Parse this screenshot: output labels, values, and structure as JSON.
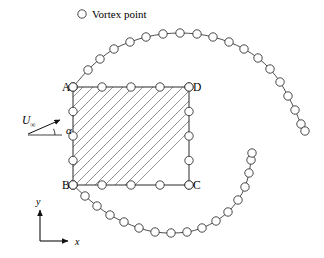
{
  "figure": {
    "width": 324,
    "height": 258,
    "background": "#ffffff",
    "type": "vortex-panel-diagram"
  },
  "legend": {
    "marker": "circle-open",
    "marker_name": "vortex-point-marker",
    "label": "Vortex point",
    "marker_x": 82,
    "marker_y": 14,
    "text_x": 92,
    "text_y": 18
  },
  "body": {
    "name": "square-body",
    "left": 73,
    "top": 87,
    "right": 189,
    "bottom": 185,
    "edge_color": "#2a2a2a",
    "hatch_color": "#777777",
    "hatch_angle_deg": 45,
    "hatch_count": 13,
    "hatch_spacing": 10,
    "corners": [
      {
        "id": "A",
        "label": "A",
        "x": 73,
        "y": 87,
        "label_x": 62,
        "label_y": 91
      },
      {
        "id": "D",
        "label": "D",
        "x": 189,
        "y": 87,
        "label_x": 193,
        "label_y": 91
      },
      {
        "id": "B",
        "label": "B",
        "x": 73,
        "y": 185,
        "label_x": 62,
        "label_y": 189
      },
      {
        "id": "C",
        "label": "C",
        "x": 189,
        "y": 185,
        "label_x": 193,
        "label_y": 189
      }
    ],
    "panel_points_per_edge": 5
  },
  "freestream": {
    "name": "freestream-velocity",
    "symbol": "U",
    "subscript": "∞",
    "label_x": 22,
    "label_y": 124,
    "arrow_tail_x": 28,
    "arrow_tail_y": 134,
    "arrow_tip_x": 60,
    "arrow_tip_y": 120,
    "ref_line_tail_x": 28,
    "ref_line_tail_y": 135,
    "ref_line_tip_x": 62,
    "ref_line_tip_y": 135,
    "angle_symbol": "α",
    "angle_label_x": 66,
    "angle_label_y": 134,
    "angle_value_deg": 24
  },
  "axes": {
    "name": "coordinate-axes",
    "origin_x": 40,
    "origin_y": 241,
    "x_label": "x",
    "x_label_x": 75,
    "x_label_y": 245,
    "x_tip_x": 68,
    "x_tip_y": 241,
    "y_label": "y",
    "y_label_x": 36,
    "y_label_y": 205,
    "y_tip_x": 40,
    "y_tip_y": 210
  },
  "vortex_sheets": [
    {
      "name": "upper-vortex-sheet",
      "origin_corner": "A",
      "points": [
        [
          73,
          87
        ],
        [
          88,
          70
        ],
        [
          100,
          59
        ],
        [
          114,
          49
        ],
        [
          130,
          42
        ],
        [
          146,
          37
        ],
        [
          163,
          34
        ],
        [
          180,
          33
        ],
        [
          197,
          34
        ],
        [
          213,
          37
        ],
        [
          229,
          42
        ],
        [
          244,
          49
        ],
        [
          258,
          58
        ],
        [
          270,
          69
        ],
        [
          280,
          82
        ],
        [
          288,
          96
        ],
        [
          295,
          110
        ],
        [
          301,
          124
        ],
        [
          305,
          131
        ]
      ]
    },
    {
      "name": "lower-vortex-sheet",
      "origin_corner": "B",
      "points": [
        [
          73,
          185
        ],
        [
          85,
          196
        ],
        [
          97,
          206
        ],
        [
          110,
          215
        ],
        [
          124,
          222
        ],
        [
          139,
          228
        ],
        [
          155,
          232
        ],
        [
          171,
          233
        ],
        [
          187,
          232
        ],
        [
          202,
          228
        ],
        [
          216,
          221
        ],
        [
          228,
          212
        ],
        [
          238,
          200
        ],
        [
          245,
          187
        ],
        [
          249,
          173
        ],
        [
          251,
          160
        ],
        [
          252,
          153
        ]
      ]
    }
  ],
  "body_vortex_points": {
    "top_edge": [
      [
        73,
        87
      ],
      [
        102,
        87
      ],
      [
        131,
        87
      ],
      [
        160,
        87
      ],
      [
        189,
        87
      ]
    ],
    "bottom_edge": [
      [
        73,
        185
      ],
      [
        102,
        185
      ],
      [
        131,
        185
      ],
      [
        160,
        185
      ],
      [
        189,
        185
      ]
    ],
    "left_edge": [
      [
        73,
        87
      ],
      [
        73,
        111.5
      ],
      [
        73,
        136
      ],
      [
        73,
        160.5
      ],
      [
        73,
        185
      ]
    ],
    "right_edge": [
      [
        189,
        87
      ],
      [
        189,
        111.5
      ],
      [
        189,
        136
      ],
      [
        189,
        160.5
      ],
      [
        189,
        185
      ]
    ]
  },
  "marker_radius": 4.2
}
